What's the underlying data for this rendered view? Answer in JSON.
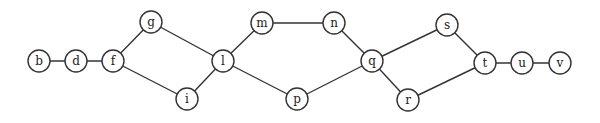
{
  "graph": {
    "node_radius": 11,
    "stroke_color": "#333333",
    "nodes": [
      {
        "id": "b",
        "label": "b",
        "x": 39,
        "y": 61
      },
      {
        "id": "d",
        "label": "d",
        "x": 76,
        "y": 61
      },
      {
        "id": "f",
        "label": "f",
        "x": 113,
        "y": 61
      },
      {
        "id": "g",
        "label": "g",
        "x": 151,
        "y": 22
      },
      {
        "id": "i",
        "label": "i",
        "x": 187,
        "y": 99
      },
      {
        "id": "l",
        "label": "l",
        "x": 223,
        "y": 61
      },
      {
        "id": "m",
        "label": "m",
        "x": 262,
        "y": 23
      },
      {
        "id": "n",
        "label": "n",
        "x": 334,
        "y": 23
      },
      {
        "id": "p",
        "label": "p",
        "x": 297,
        "y": 99
      },
      {
        "id": "q",
        "label": "q",
        "x": 372,
        "y": 61
      },
      {
        "id": "s",
        "label": "s",
        "x": 447,
        "y": 25
      },
      {
        "id": "r",
        "label": "r",
        "x": 408,
        "y": 100
      },
      {
        "id": "t",
        "label": "t",
        "x": 485,
        "y": 63
      },
      {
        "id": "u",
        "label": "u",
        "x": 522,
        "y": 63
      },
      {
        "id": "v",
        "label": "v",
        "x": 560,
        "y": 63
      }
    ],
    "edges": [
      [
        "b",
        "d"
      ],
      [
        "d",
        "f"
      ],
      [
        "f",
        "g"
      ],
      [
        "f",
        "i"
      ],
      [
        "g",
        "l"
      ],
      [
        "i",
        "l"
      ],
      [
        "l",
        "m"
      ],
      [
        "l",
        "p"
      ],
      [
        "m",
        "n"
      ],
      [
        "n",
        "q"
      ],
      [
        "p",
        "q"
      ],
      [
        "q",
        "s"
      ],
      [
        "q",
        "r"
      ],
      [
        "s",
        "t"
      ],
      [
        "r",
        "t"
      ],
      [
        "t",
        "u"
      ],
      [
        "u",
        "v"
      ]
    ]
  }
}
